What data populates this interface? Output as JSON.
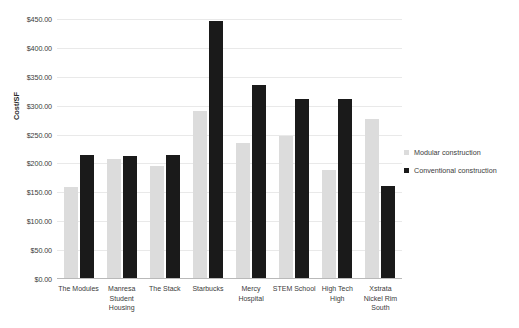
{
  "chart_data": {
    "type": "bar",
    "title": "",
    "subtitle": "",
    "xlabel": "",
    "ylabel": "Cost/SF",
    "ylim": [
      0,
      450
    ],
    "ytick_step": 50,
    "ytick_labels": [
      "$450.00",
      "$400.00",
      "$350.00",
      "$300.00",
      "$250.00",
      "$200.00",
      "$150.00",
      "$100.00",
      "$50.00",
      "$0.00"
    ],
    "ytick_values": [
      450,
      400,
      350,
      300,
      250,
      200,
      150,
      100,
      50,
      0
    ],
    "grid": true,
    "legend_position": "right",
    "categories": [
      "The Modules",
      "Manresa Student Housing",
      "The Stack",
      "Starbucks",
      "Mercy Hospital",
      "STEM School",
      "High Tech High",
      "Xstrata Nickel Rim South"
    ],
    "category_lines": [
      [
        "The Modules"
      ],
      [
        "Manresa",
        "Student",
        "Housing"
      ],
      [
        "The Stack"
      ],
      [
        "Starbucks"
      ],
      [
        "Mercy",
        "Hospital"
      ],
      [
        "STEM School"
      ],
      [
        "High Tech",
        "High"
      ],
      [
        "Xstrata",
        "Nickel Rim",
        "South"
      ]
    ],
    "series": [
      {
        "name": "Modular construction",
        "color": "#dcdcdc",
        "values": [
          160,
          207,
          195,
          290,
          235,
          247,
          189,
          277
        ]
      },
      {
        "name": "Conventional construction",
        "color": "#1a1a1a",
        "values": [
          214,
          213,
          214,
          447,
          336,
          311,
          311,
          161
        ]
      }
    ]
  },
  "legend": {
    "items": [
      {
        "label": "Modular construction",
        "swatch": "modular"
      },
      {
        "label": "Conventional construction",
        "swatch": "conventional"
      }
    ]
  }
}
